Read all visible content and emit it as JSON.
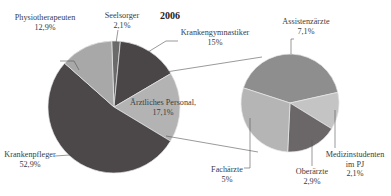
{
  "chart_data": [
    {
      "type": "pie",
      "title": "2006",
      "slices": [
        {
          "label": "Seelsorger",
          "value": 2.1,
          "display": "2,1%",
          "color": "#6a6a6a"
        },
        {
          "label": "Krankengymnastiker",
          "value": 15.0,
          "display": "15%",
          "color": "#4a4547"
        },
        {
          "label": "Ärztliches Personal,",
          "value": 17.1,
          "display": "17,1%",
          "color": "#b3b3b3"
        },
        {
          "label": "Krankenpfleger",
          "value": 52.9,
          "display": "52,9%",
          "color": "#4c484a"
        },
        {
          "label": "Physiotherapeuten",
          "value": 12.9,
          "display": "12,9%",
          "color": "#a8a8a8"
        }
      ],
      "start_angle_deg": -2,
      "exploded_slice": "Ärztliches Personal,"
    },
    {
      "type": "pie",
      "title": "Ärztliches Personal breakdown",
      "slices": [
        {
          "label": "Assistenzärzte",
          "value": 7.1,
          "display": "7,1%",
          "color": "#8e8e8e"
        },
        {
          "label": "Medizinstudenten im PJ",
          "value": 2.1,
          "display": "2,1%",
          "color": "#c4c4c4"
        },
        {
          "label": "Oberärzte",
          "value": 2.9,
          "display": "2,9%",
          "color": "#6b6769"
        },
        {
          "label": "Fachärzte",
          "value": 5.0,
          "display": "5%",
          "color": "#b5b5b5"
        }
      ],
      "start_angle_deg": -72
    }
  ],
  "labels": {
    "title": "2006",
    "physio": {
      "name": "Physiotherapeuten",
      "pct": "12,9%"
    },
    "seelsorger": {
      "name": "Seelsorger",
      "pct": "2,1%"
    },
    "krankengym": {
      "name": "Krankengymnastiker",
      "pct": "15%"
    },
    "aerztl": {
      "name": "Ärztliches Personal,",
      "pct": "17,1%"
    },
    "krankenpfleger": {
      "name": "Krankenpfleger",
      "pct": "52,9%"
    },
    "assistenz": {
      "name": "Assistenzärzte",
      "pct": "7,1%"
    },
    "fach": {
      "name": "Fachärzte",
      "pct": "5%"
    },
    "ober": {
      "name": "Oberärzte",
      "pct": "2,9%"
    },
    "medstud": {
      "name": "Medizinstudenten",
      "name2": "im PJ",
      "pct": "2,1%"
    }
  }
}
